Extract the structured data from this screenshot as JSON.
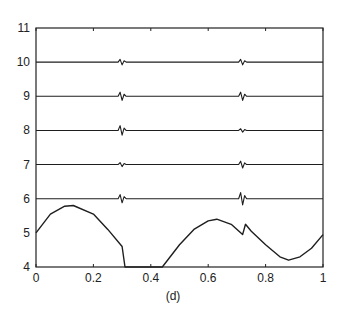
{
  "chart_data": {
    "type": "line",
    "title": "",
    "caption": "(d)",
    "xlabel": "",
    "ylabel": "",
    "xlim": [
      0,
      1
    ],
    "ylim": [
      4,
      11
    ],
    "grid": false,
    "x_ticks": [
      "0",
      "0.2",
      "0.4",
      "0.6",
      "0.8",
      "1"
    ],
    "y_ticks": [
      "4",
      "5",
      "6",
      "7",
      "8",
      "9",
      "10",
      "11"
    ],
    "series": [
      {
        "name": "signal",
        "baseline": 5,
        "x": [
          0,
          0.05,
          0.1,
          0.13,
          0.2,
          0.25,
          0.3,
          0.31,
          0.44,
          0.5,
          0.55,
          0.6,
          0.63,
          0.68,
          0.72,
          0.73,
          0.75,
          0.8,
          0.85,
          0.88,
          0.92,
          0.96,
          1.0
        ],
        "y": [
          5.0,
          5.55,
          5.78,
          5.8,
          5.55,
          5.1,
          4.6,
          4.0,
          4.0,
          4.65,
          5.1,
          5.35,
          5.4,
          5.25,
          4.95,
          5.25,
          5.05,
          4.65,
          4.3,
          4.2,
          4.3,
          4.55,
          4.95
        ]
      },
      {
        "name": "detail level 6",
        "baseline": 6,
        "spikes_at": [
          0.3,
          0.72
        ],
        "amplitude": [
          0.12,
          0.18
        ]
      },
      {
        "name": "detail level 7",
        "baseline": 7,
        "spikes_at": [
          0.3,
          0.72
        ],
        "amplitude": [
          0.06,
          0.1
        ]
      },
      {
        "name": "detail level 8",
        "baseline": 8,
        "spikes_at": [
          0.3,
          0.72
        ],
        "amplitude": [
          0.14,
          0.05
        ]
      },
      {
        "name": "detail level 9",
        "baseline": 9,
        "spikes_at": [
          0.3,
          0.72
        ],
        "amplitude": [
          0.12,
          0.12
        ]
      },
      {
        "name": "detail level 10",
        "baseline": 10,
        "spikes_at": [
          0.3,
          0.72
        ],
        "amplitude": [
          0.08,
          0.08
        ]
      }
    ]
  },
  "colors": {
    "line": "#1e1e1e",
    "axis": "#222222",
    "background": "#ffffff"
  }
}
